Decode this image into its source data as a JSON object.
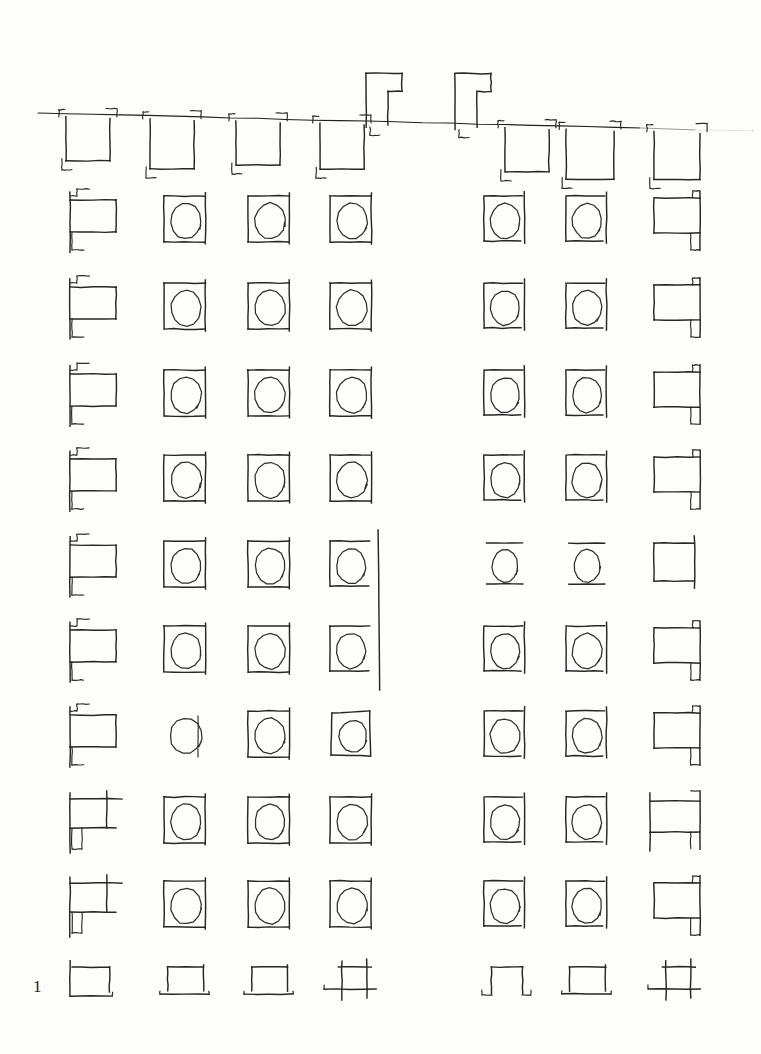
{
  "document": {
    "kind": "handwritten-glyph-practice-sheet",
    "title": "Asemic glyph practice sheet",
    "page_number": "1",
    "background_color": "#fdfdfc",
    "ink_color": "#262626",
    "width": 761,
    "height": 1054
  },
  "ruled_line": {
    "name": "baseline-rule",
    "x1": 38,
    "y1": 113,
    "x2": 752,
    "y2": 131,
    "fade_start_x": 640,
    "note": "single hand-ruled horizontal line across top, fading out at right"
  },
  "header_row": {
    "label": "top-row-hanging-glyphs",
    "count": 9,
    "baseline_y": 118,
    "glyphs": [
      {
        "id": "h1",
        "x": 66,
        "width": 44,
        "height": 44,
        "ascender": false,
        "form": "bracket-box-down"
      },
      {
        "id": "h2",
        "x": 150,
        "width": 44,
        "height": 50,
        "ascender": false,
        "form": "bracket-box-down"
      },
      {
        "id": "h3",
        "x": 236,
        "width": 44,
        "height": 44,
        "ascender": false,
        "form": "bracket-box-down"
      },
      {
        "id": "h4",
        "x": 320,
        "width": 44,
        "height": 46,
        "ascender": false,
        "form": "bracket-box-down"
      },
      {
        "id": "h5",
        "x": 366,
        "width": 36,
        "height": 48,
        "ascender": true,
        "form": "tall-hook-up"
      },
      {
        "id": "h6",
        "x": 455,
        "width": 36,
        "height": 50,
        "ascender": true,
        "form": "tall-hook-up"
      },
      {
        "id": "h7",
        "x": 505,
        "width": 44,
        "height": 44,
        "ascender": false,
        "form": "bracket-box-down"
      },
      {
        "id": "h8",
        "x": 566,
        "width": 48,
        "height": 50,
        "ascender": false,
        "form": "bracket-box-down"
      },
      {
        "id": "h9",
        "x": 654,
        "width": 46,
        "height": 48,
        "ascender": false,
        "form": "bracket-box-down"
      }
    ]
  },
  "grid": {
    "label": "glyph-grid",
    "rows": 10,
    "columns": 7,
    "column_x": [
      70,
      164,
      248,
      330,
      484,
      566,
      654
    ],
    "row_y": [
      196,
      283,
      370,
      455,
      541,
      626,
      711,
      797,
      881,
      963
    ],
    "gap_between_columns": [
      4,
      5
    ],
    "cell_width": 46,
    "cell_height": 50,
    "cells": [
      {
        "row": 1,
        "col": 1,
        "form": "flag-box"
      },
      {
        "row": 1,
        "col": 2,
        "form": "circle-in-box"
      },
      {
        "row": 1,
        "col": 3,
        "form": "circle-in-box"
      },
      {
        "row": 1,
        "col": 4,
        "form": "circle-in-box"
      },
      {
        "row": 1,
        "col": 5,
        "form": "circle-in-box-r"
      },
      {
        "row": 1,
        "col": 6,
        "form": "circle-in-box-r"
      },
      {
        "row": 1,
        "col": 7,
        "form": "flag-box-mirror"
      },
      {
        "row": 2,
        "col": 1,
        "form": "flag-box"
      },
      {
        "row": 2,
        "col": 2,
        "form": "circle-in-box"
      },
      {
        "row": 2,
        "col": 3,
        "form": "circle-in-box"
      },
      {
        "row": 2,
        "col": 4,
        "form": "circle-in-box"
      },
      {
        "row": 2,
        "col": 5,
        "form": "circle-in-box-r"
      },
      {
        "row": 2,
        "col": 6,
        "form": "circle-in-box-r"
      },
      {
        "row": 2,
        "col": 7,
        "form": "flag-box-mirror"
      },
      {
        "row": 3,
        "col": 1,
        "form": "flag-box"
      },
      {
        "row": 3,
        "col": 2,
        "form": "circle-in-box"
      },
      {
        "row": 3,
        "col": 3,
        "form": "circle-in-box"
      },
      {
        "row": 3,
        "col": 4,
        "form": "circle-in-box"
      },
      {
        "row": 3,
        "col": 5,
        "form": "circle-in-box-r"
      },
      {
        "row": 3,
        "col": 6,
        "form": "circle-in-box-r"
      },
      {
        "row": 3,
        "col": 7,
        "form": "flag-box-mirror"
      },
      {
        "row": 4,
        "col": 1,
        "form": "flag-box"
      },
      {
        "row": 4,
        "col": 2,
        "form": "circle-in-box"
      },
      {
        "row": 4,
        "col": 3,
        "form": "circle-in-box"
      },
      {
        "row": 4,
        "col": 4,
        "form": "circle-in-box"
      },
      {
        "row": 4,
        "col": 5,
        "form": "circle-in-box-r"
      },
      {
        "row": 4,
        "col": 6,
        "form": "circle-in-box-r"
      },
      {
        "row": 4,
        "col": 7,
        "form": "flag-box-mirror"
      },
      {
        "row": 5,
        "col": 1,
        "form": "flag-box"
      },
      {
        "row": 5,
        "col": 2,
        "form": "circle-in-box"
      },
      {
        "row": 5,
        "col": 3,
        "form": "circle-in-box"
      },
      {
        "row": 5,
        "col": 4,
        "form": "circle-in-box-tail"
      },
      {
        "row": 5,
        "col": 5,
        "form": "circle-open"
      },
      {
        "row": 5,
        "col": 6,
        "form": "circle-open"
      },
      {
        "row": 5,
        "col": 7,
        "form": "plain-box"
      },
      {
        "row": 6,
        "col": 1,
        "form": "flag-box"
      },
      {
        "row": 6,
        "col": 2,
        "form": "circle-in-box"
      },
      {
        "row": 6,
        "col": 3,
        "form": "circle-in-box"
      },
      {
        "row": 6,
        "col": 4,
        "form": "circle-in-box-tail"
      },
      {
        "row": 6,
        "col": 5,
        "form": "circle-in-box-r"
      },
      {
        "row": 6,
        "col": 6,
        "form": "circle-in-box-r"
      },
      {
        "row": 6,
        "col": 7,
        "form": "flag-box-mirror"
      },
      {
        "row": 7,
        "col": 1,
        "form": "flag-box"
      },
      {
        "row": 7,
        "col": 2,
        "form": "circle-plain"
      },
      {
        "row": 7,
        "col": 3,
        "form": "circle-in-box"
      },
      {
        "row": 7,
        "col": 4,
        "form": "rounded-box"
      },
      {
        "row": 7,
        "col": 5,
        "form": "circle-in-box-r"
      },
      {
        "row": 7,
        "col": 6,
        "form": "circle-in-box-r"
      },
      {
        "row": 7,
        "col": 7,
        "form": "flag-box-mirror"
      },
      {
        "row": 8,
        "col": 1,
        "form": "flag-box-cross"
      },
      {
        "row": 8,
        "col": 2,
        "form": "circle-in-box"
      },
      {
        "row": 8,
        "col": 3,
        "form": "circle-in-box"
      },
      {
        "row": 8,
        "col": 4,
        "form": "circle-in-box"
      },
      {
        "row": 8,
        "col": 5,
        "form": "circle-in-box-r"
      },
      {
        "row": 8,
        "col": 6,
        "form": "circle-in-box-r"
      },
      {
        "row": 8,
        "col": 7,
        "form": "flag-box-mirror-tall"
      },
      {
        "row": 9,
        "col": 1,
        "form": "flag-box-cross"
      },
      {
        "row": 9,
        "col": 2,
        "form": "circle-in-box"
      },
      {
        "row": 9,
        "col": 3,
        "form": "circle-in-box"
      },
      {
        "row": 9,
        "col": 4,
        "form": "circle-in-box"
      },
      {
        "row": 9,
        "col": 5,
        "form": "circle-in-box-r"
      },
      {
        "row": 9,
        "col": 6,
        "form": "circle-in-box-r"
      },
      {
        "row": 9,
        "col": 7,
        "form": "flag-box-mirror"
      },
      {
        "row": 10,
        "col": 1,
        "form": "base-box"
      },
      {
        "row": 10,
        "col": 2,
        "form": "base-box-foot"
      },
      {
        "row": 10,
        "col": 3,
        "form": "base-box-foot"
      },
      {
        "row": 10,
        "col": 4,
        "form": "base-box-cross"
      },
      {
        "row": 10,
        "col": 5,
        "form": "base-box-ears"
      },
      {
        "row": 10,
        "col": 6,
        "form": "base-box-foot"
      },
      {
        "row": 10,
        "col": 7,
        "form": "base-box-cross"
      }
    ]
  },
  "stray_marks": [
    {
      "name": "long-vertical-stroke",
      "x": 378,
      "y1": 530,
      "y2": 690,
      "note": "descender stroke spanning rows 5-6 at column 4"
    }
  ]
}
